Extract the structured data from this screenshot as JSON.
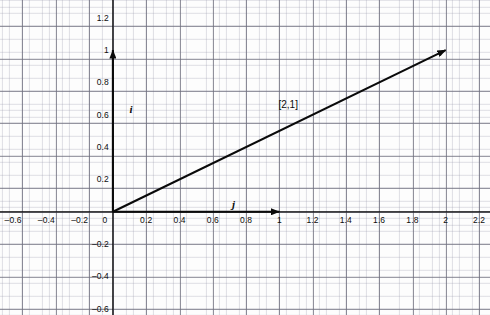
{
  "chart_data": {
    "type": "scatter",
    "title": "",
    "subtitle": "",
    "xlabel": "",
    "ylabel": "",
    "xlim": [
      -0.68,
      2.27
    ],
    "ylim": [
      -0.64,
      1.31
    ],
    "grid": true,
    "grid_major_step": 0.2,
    "grid_minor_step": 0.04,
    "legend": "none",
    "x_ticks": [
      {
        "value": -0.6,
        "label": "–0.6"
      },
      {
        "value": -0.4,
        "label": "–0.4"
      },
      {
        "value": -0.2,
        "label": "–0.2"
      },
      {
        "value": 0,
        "label": "0"
      },
      {
        "value": 0.2,
        "label": "0.2"
      },
      {
        "value": 0.4,
        "label": "0.4"
      },
      {
        "value": 0.6,
        "label": "0.6"
      },
      {
        "value": 0.8,
        "label": "0.8"
      },
      {
        "value": 1.0,
        "label": "1"
      },
      {
        "value": 1.2,
        "label": "1.2"
      },
      {
        "value": 1.4,
        "label": "1.4"
      },
      {
        "value": 1.6,
        "label": "1.6"
      },
      {
        "value": 1.8,
        "label": "1.8"
      },
      {
        "value": 2.0,
        "label": "2"
      },
      {
        "value": 2.2,
        "label": "2.2"
      }
    ],
    "y_ticks": [
      {
        "value": 1.2,
        "label": "1.2"
      },
      {
        "value": 1.0,
        "label": "1"
      },
      {
        "value": 0.8,
        "label": "0.8"
      },
      {
        "value": 0.6,
        "label": "0.6"
      },
      {
        "value": 0.4,
        "label": "0.4"
      },
      {
        "value": 0.2,
        "label": "0.2"
      },
      {
        "value": -0.2,
        "label": "–0.2"
      },
      {
        "value": -0.4,
        "label": "–0.4"
      },
      {
        "value": -0.6,
        "label": "–0.6"
      }
    ],
    "vectors": [
      {
        "name": "i-basis-vector",
        "label": "i",
        "from": [
          0,
          0
        ],
        "to": [
          0,
          1
        ],
        "label_at": [
          0.1,
          0.67
        ]
      },
      {
        "name": "j-basis-vector",
        "label": "j",
        "from": [
          0,
          0
        ],
        "to": [
          1,
          0
        ],
        "label_at": [
          0.715,
          0.085
        ]
      },
      {
        "name": "resultant-vector",
        "label": "[2,1]",
        "from": [
          0,
          0
        ],
        "to": [
          2,
          1
        ],
        "label_at": [
          0.995,
          0.695
        ]
      }
    ],
    "colors": {
      "background": "#fdfdfd",
      "major_grid": "#6e6e7d",
      "minor_grid": "#9696aa",
      "vector": "#0a0a0a",
      "tick_text": "#0d0d0d"
    }
  }
}
